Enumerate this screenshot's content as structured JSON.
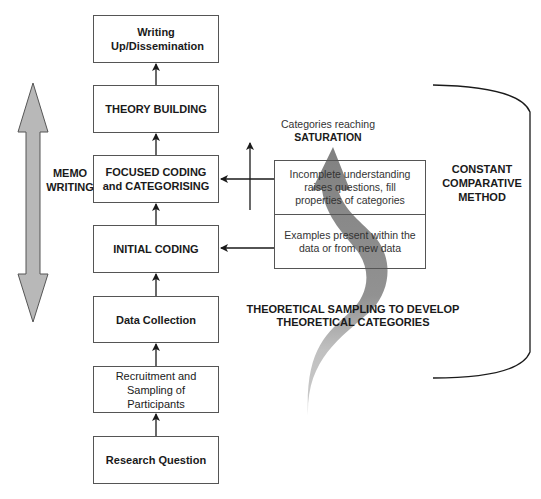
{
  "diagram": {
    "type": "grounded-theory-process-flowchart",
    "main_flow": [
      {
        "id": "writing",
        "label": "Writing Up/Dissemination",
        "style": "bold"
      },
      {
        "id": "theory",
        "label": "THEORY BUILDING",
        "style": "bold"
      },
      {
        "id": "focused",
        "label": "FOCUSED CODING and CATEGORISING",
        "style": "bold"
      },
      {
        "id": "initial",
        "label": "INITIAL CODING",
        "style": "bold"
      },
      {
        "id": "data",
        "label": "Data Collection",
        "style": "bold"
      },
      {
        "id": "recruit",
        "label": "Recruitment and Sampling of Participants",
        "style": "normal"
      },
      {
        "id": "question",
        "label": "Research Question",
        "style": "bold"
      }
    ],
    "flow_direction": "bottom-to-top",
    "side_labels": {
      "memo": "MEMO WRITING",
      "constant": "CONSTANT COMPARATIVE METHOD",
      "theoretical_sampling": "THEORETICAL SAMPLING TO DEVELOP THEORETICAL CATEGORIES",
      "saturation_prefix": "Categories reaching",
      "saturation": "SATURATION"
    },
    "feedback_boxes": [
      {
        "id": "incomplete",
        "label": "Incomplete understanding raises questions, fill properties of categories",
        "arrow_to": "focused"
      },
      {
        "id": "examples",
        "label": "Examples present within the data or from new data",
        "arrow_to": "initial"
      }
    ],
    "colors": {
      "border": "#555555",
      "memo_arrow_fill": "#b8b8b8",
      "curve_arrow_dark": "#7a7a7a",
      "curve_arrow_light": "#c4c4c4"
    }
  }
}
